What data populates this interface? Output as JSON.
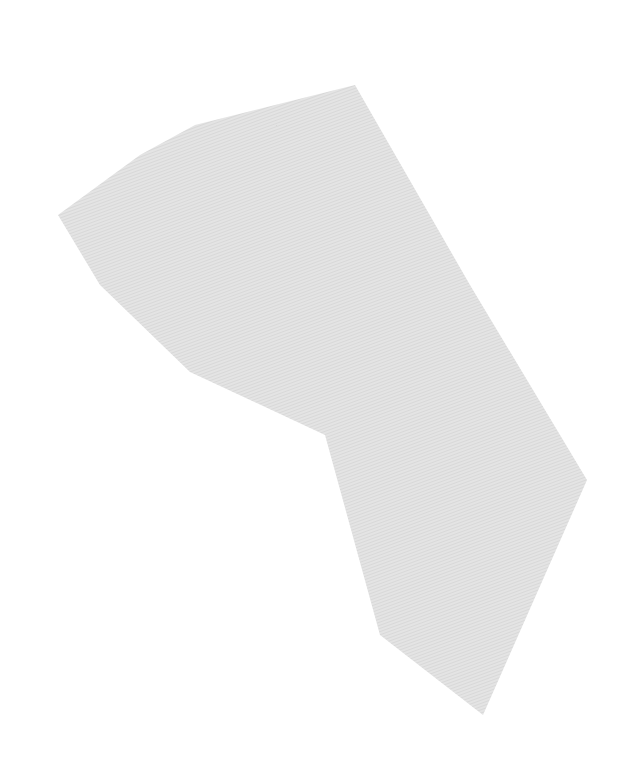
{
  "canvas": {
    "width": 642,
    "height": 782,
    "background": "#ffffff"
  },
  "shape": {
    "kind": "textured-polygon",
    "fill": "#e3e3e3",
    "hatch_color": "#d2d2d2",
    "points": "355,85 195,125 140,155 58,215 100,285 190,372 325,435 380,635 483,715 587,480 470,285"
  }
}
